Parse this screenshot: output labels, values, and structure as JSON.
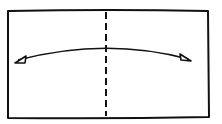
{
  "diagram": {
    "type": "fold-diagram",
    "paper": {
      "shape": "rectangle",
      "stroke": "#111111",
      "fill": "#ffffff"
    },
    "fold_line": {
      "style": "dashed",
      "orientation": "vertical",
      "position": "center"
    },
    "arrow": {
      "style": "curved",
      "heads": "both",
      "direction": "left-right"
    },
    "colors": {
      "ink": "#111111",
      "background": "#ffffff"
    }
  }
}
